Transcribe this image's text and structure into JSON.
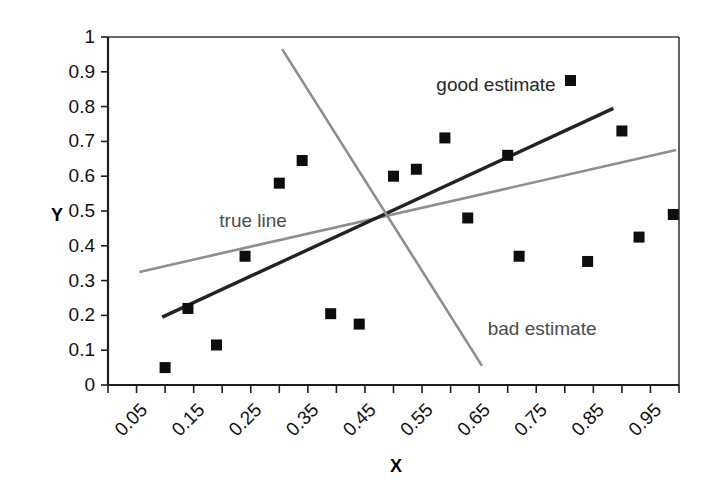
{
  "chart_data": {
    "type": "scatter",
    "title": "",
    "xlabel": "X",
    "ylabel": "Y",
    "xlim": [
      0.0,
      1.0
    ],
    "ylim": [
      0.0,
      1.0
    ],
    "grid": false,
    "frame": "box",
    "legend_position": "inline-annotations",
    "xticks": [
      0.05,
      0.15,
      0.25,
      0.35,
      0.45,
      0.55,
      0.65,
      0.75,
      0.85,
      0.95
    ],
    "xtick_labels": [
      "0.05",
      "0.15",
      "0.25",
      "0.35",
      "0.45",
      "0.55",
      "0.65",
      "0.75",
      "0.85",
      "0.95"
    ],
    "xtick_label_rotation": 45,
    "yticks": [
      0,
      0.1,
      0.2,
      0.3,
      0.4,
      0.5,
      0.6,
      0.7,
      0.8,
      0.9,
      1
    ],
    "ytick_labels": [
      "0",
      "0.1",
      "0.2",
      "0.3",
      "0.4",
      "0.5",
      "0.6",
      "0.7",
      "0.8",
      "0.9",
      "1"
    ],
    "points": [
      {
        "x": 0.1,
        "y": 0.05
      },
      {
        "x": 0.14,
        "y": 0.22
      },
      {
        "x": 0.19,
        "y": 0.115
      },
      {
        "x": 0.24,
        "y": 0.37
      },
      {
        "x": 0.3,
        "y": 0.58
      },
      {
        "x": 0.34,
        "y": 0.645
      },
      {
        "x": 0.39,
        "y": 0.205
      },
      {
        "x": 0.44,
        "y": 0.175
      },
      {
        "x": 0.5,
        "y": 0.6
      },
      {
        "x": 0.54,
        "y": 0.62
      },
      {
        "x": 0.59,
        "y": 0.71
      },
      {
        "x": 0.63,
        "y": 0.48
      },
      {
        "x": 0.7,
        "y": 0.66
      },
      {
        "x": 0.72,
        "y": 0.37
      },
      {
        "x": 0.81,
        "y": 0.875
      },
      {
        "x": 0.84,
        "y": 0.355
      },
      {
        "x": 0.9,
        "y": 0.73
      },
      {
        "x": 0.93,
        "y": 0.425
      },
      {
        "x": 0.99,
        "y": 0.49
      }
    ],
    "lines": [
      {
        "name": "true line",
        "label": "true line",
        "color": "#8e8e8e",
        "style": "solid",
        "x0": 0.055,
        "y0": 0.325,
        "x1": 0.995,
        "y1": 0.675,
        "label_x": 0.195,
        "label_y": 0.455
      },
      {
        "name": "good estimate",
        "label": "good estimate",
        "color": "#232323",
        "style": "solid",
        "x0": 0.095,
        "y0": 0.195,
        "x1": 0.885,
        "y1": 0.795,
        "label_x": 0.575,
        "label_y": 0.845
      },
      {
        "name": "bad estimate",
        "label": "bad estimate",
        "color": "#8e8e8e",
        "style": "solid",
        "x0": 0.305,
        "y0": 0.965,
        "x1": 0.655,
        "y1": 0.055,
        "label_x": 0.665,
        "label_y": 0.145
      }
    ],
    "annotations": [
      {
        "text": "true line",
        "x": 0.195,
        "y": 0.455
      },
      {
        "text": "good estimate",
        "x": 0.575,
        "y": 0.845
      },
      {
        "text": "bad estimate",
        "x": 0.665,
        "y": 0.145
      }
    ],
    "colors": {
      "marker": "#0d0d0d",
      "true_line": "#8e8e8e",
      "good_estimate": "#232323",
      "bad_estimate": "#8e8e8e",
      "axis": "#1d1d1d",
      "background": "#ffffff"
    }
  },
  "axis_titles": {
    "x": "X",
    "y": "Y"
  }
}
